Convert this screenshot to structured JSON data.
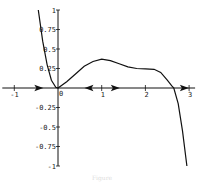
{
  "chart_data": {
    "type": "line",
    "title": "",
    "xlabel": "",
    "ylabel": "",
    "xlim": [
      -1,
      3
    ],
    "ylim": [
      -1,
      1
    ],
    "grid": false,
    "x_ticks": [
      "-1",
      "0",
      "1",
      "2",
      "3"
    ],
    "y_ticks": [
      "1",
      "0.75",
      "0.5",
      "0.25",
      "-0.25",
      "-0.5",
      "-0.75",
      "-1"
    ],
    "origin_label": "0",
    "series": [
      {
        "name": "f(x)",
        "x": [
          -0.45,
          -0.35,
          -0.25,
          -0.15,
          -0.05,
          0,
          0.2,
          0.4,
          0.6,
          0.8,
          1.0,
          1.2,
          1.4,
          1.6,
          1.8,
          2.0,
          2.2,
          2.35,
          2.5,
          2.6,
          2.65,
          2.75,
          2.85,
          2.95
        ],
        "y": [
          1.0,
          0.6,
          0.3,
          0.1,
          0.01,
          0.0,
          0.08,
          0.18,
          0.28,
          0.34,
          0.37,
          0.35,
          0.31,
          0.27,
          0.25,
          0.245,
          0.24,
          0.2,
          0.1,
          0.03,
          0.0,
          -0.2,
          -0.55,
          -1.0
        ]
      }
    ],
    "annotations": [
      {
        "type": "phase-arrow",
        "x": -0.45,
        "direction": "right"
      },
      {
        "type": "phase-arrow",
        "x": 0.72,
        "direction": "left"
      },
      {
        "type": "phase-arrow",
        "x": 1.3,
        "direction": "right"
      },
      {
        "type": "phase-arrow",
        "x": 2.88,
        "direction": "right"
      }
    ]
  },
  "caption": "Figure"
}
